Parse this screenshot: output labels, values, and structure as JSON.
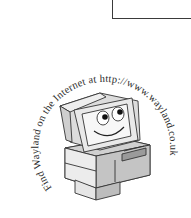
{
  "page": {
    "box": {
      "present": true
    },
    "logo": {
      "ring_text": "Find Wayland on the Internet at http://www.wayland.co.uk",
      "illustration": "smiling-computer-icon",
      "colors": {
        "text": "#2a2a2a",
        "outline": "#333333",
        "light_face": "#f0f0f0",
        "mid_face": "#d4d4d4",
        "dark_face": "#a8a8a8"
      }
    }
  }
}
